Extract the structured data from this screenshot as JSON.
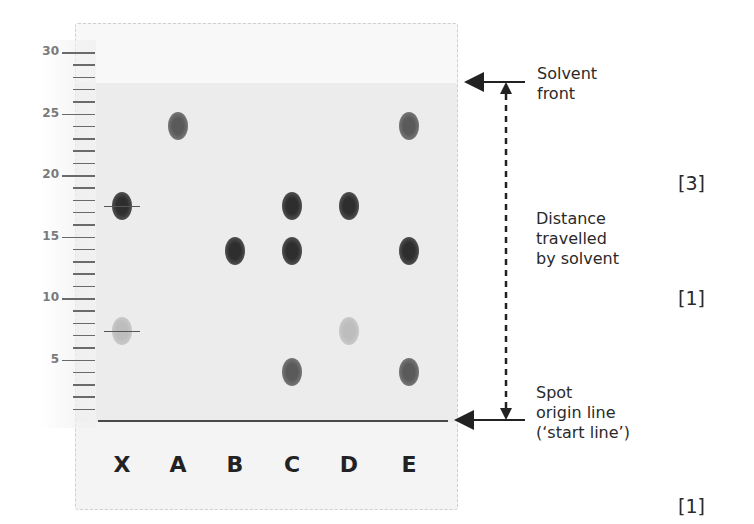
{
  "ruler": {
    "labels": [
      "30",
      "25",
      "20",
      "15",
      "10",
      "5"
    ],
    "unit_px": 12.3,
    "zero_y": 421
  },
  "lanes": [
    {
      "label": "X",
      "x": 122
    },
    {
      "label": "A",
      "x": 178
    },
    {
      "label": "B",
      "x": 235
    },
    {
      "label": "C",
      "x": 292
    },
    {
      "label": "D",
      "x": 349
    },
    {
      "label": "E",
      "x": 409
    }
  ],
  "spots": [
    {
      "lane": "X",
      "value": 17.5,
      "shade": "dark",
      "marked": true
    },
    {
      "lane": "X",
      "value": 7.3,
      "shade": "light",
      "marked": true
    },
    {
      "lane": "A",
      "value": 24,
      "shade": "mid"
    },
    {
      "lane": "B",
      "value": 13.8,
      "shade": "dark"
    },
    {
      "lane": "C",
      "value": 17.5,
      "shade": "dark"
    },
    {
      "lane": "C",
      "value": 13.8,
      "shade": "dark"
    },
    {
      "lane": "C",
      "value": 4,
      "shade": "mid"
    },
    {
      "lane": "D",
      "value": 17.5,
      "shade": "dark"
    },
    {
      "lane": "D",
      "value": 7.3,
      "shade": "light"
    },
    {
      "lane": "E",
      "value": 24,
      "shade": "mid"
    },
    {
      "lane": "E",
      "value": 13.8,
      "shade": "dark"
    },
    {
      "lane": "E",
      "value": 4,
      "shade": "mid"
    }
  ],
  "annotations": {
    "solvent_front": [
      "Solvent",
      "front"
    ],
    "distance": [
      "Distance",
      "travelled",
      "by solvent"
    ],
    "origin": [
      "Spot",
      "origin line",
      "(‘start line’)"
    ]
  },
  "marks": {
    "m1": "[3]",
    "m2": "[1]",
    "m3": "[1]"
  }
}
